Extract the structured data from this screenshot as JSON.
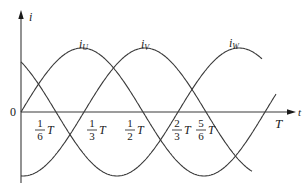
{
  "diagram": {
    "type": "three-phase sinusoidal currents",
    "axes": {
      "y_label": "i",
      "x_label": "t",
      "origin_label": "0",
      "period_label": "T"
    },
    "tick_labels": [
      {
        "num": "1",
        "den": "6",
        "suffix": "T"
      },
      {
        "num": "1",
        "den": "3",
        "suffix": "T"
      },
      {
        "num": "1",
        "den": "2",
        "suffix": "T"
      },
      {
        "num": "2",
        "den": "3",
        "suffix": "T"
      },
      {
        "num": "5",
        "den": "6",
        "suffix": "T"
      }
    ],
    "curves": [
      {
        "name": "i",
        "sub": "U"
      },
      {
        "name": "i",
        "sub": "V"
      },
      {
        "name": "i",
        "sub": "W"
      }
    ],
    "colors": {
      "stroke": "#3a3a3a",
      "text": "#1a1a1a",
      "background": "#ffffff"
    }
  }
}
